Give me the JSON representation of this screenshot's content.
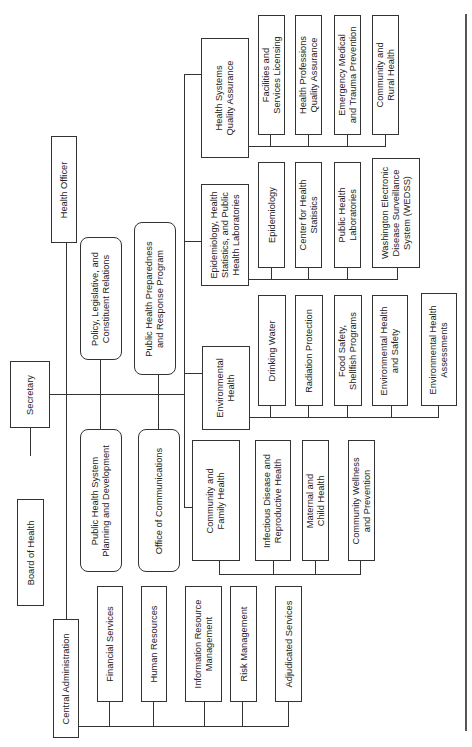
{
  "chart_title": "Organizational chart (rotated 90°)",
  "nodes": {
    "board_of_health": "Board of Health",
    "secretary": "Secretary",
    "health_officer": "Health Officer",
    "central_administration": "Central Administration",
    "financial_services": "Financial Services",
    "human_resources": "Human Resources",
    "information_resource_management": "Information Resource\nManagement",
    "risk_management": "Risk Management",
    "adjudicated_services": "Adjudicated Services",
    "public_health_system_planning": "Public Health System\nPlanning and Development",
    "office_of_communications": "Office of Communications",
    "policy_legislative": "Policy, Legislative, and\nConstituent Relations",
    "public_health_preparedness": "Public Health Preparedness\nand Response Program",
    "community_family_health": "Community and\nFamily Health",
    "infectious_disease": "Infectious Disease and\nReproductive Health",
    "maternal_child_health": "Maternal and\nChild Health",
    "community_wellness": "Community Wellness\nand Prevention",
    "environmental_health": "Environmental\nHealth",
    "drinking_water": "Drinking Water",
    "radiation_protection": "Radiation Protection",
    "food_safety": "Food Safety,\nShellfish Programs",
    "env_health_safety": "Environmental Health\nand Safety",
    "env_health_assessments": "Environmental Health\nAssessments",
    "epidemiology_division": "Epidemiology, Health\nStatistics, and Public\nHealth Laboratories",
    "epidemiology": "Epidemiology",
    "center_health_statistics": "Center for Health\nStatistics",
    "public_health_laboratories": "Public Health\nLaboratories",
    "wedss": "Washington Electronic\nDisease Surveillance\nSystem (WEDSS)",
    "health_systems_qa": "Health Systems\nQuality Assurance",
    "facilities_licensing": "Facilities and\nServices Licensing",
    "health_professions_qa": "Health Professions\nQuality Assurance",
    "emergency_medical": "Emergency Medical\nand Trauma Prevention",
    "community_rural_health": "Community and\nRural Health"
  }
}
